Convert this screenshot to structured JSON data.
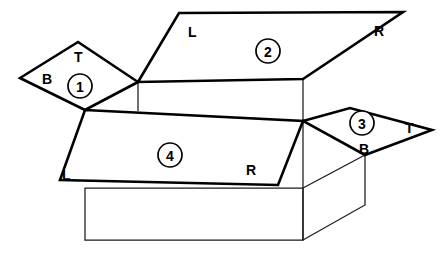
{
  "diagram": {
    "type": "line-drawing",
    "background_color": "#ffffff",
    "line_color": "#000000",
    "flaps": [
      {
        "id": "flap-1",
        "badge": "1",
        "badge_cx": 80,
        "badge_cy": 86,
        "position": "left",
        "edge_labels": [
          {
            "text": "T",
            "x": 74,
            "y": 62
          },
          {
            "text": "B",
            "x": 42,
            "y": 84
          }
        ]
      },
      {
        "id": "flap-2",
        "badge": "2",
        "badge_cx": 268,
        "badge_cy": 51,
        "position": "back",
        "edge_labels": [
          {
            "text": "L",
            "x": 188,
            "y": 37
          },
          {
            "text": "R",
            "x": 374,
            "y": 36
          }
        ]
      },
      {
        "id": "flap-3",
        "badge": "3",
        "badge_cx": 362,
        "badge_cy": 123,
        "position": "right",
        "edge_labels": [
          {
            "text": "T",
            "x": 405,
            "y": 133
          },
          {
            "text": "B",
            "x": 364,
            "y": 152
          }
        ]
      },
      {
        "id": "flap-4",
        "badge": "4",
        "badge_cx": 170,
        "badge_cy": 155,
        "position": "front",
        "edge_labels": [
          {
            "text": "L",
            "x": 67,
            "y": 178
          },
          {
            "text": "R",
            "x": 248,
            "y": 175
          }
        ]
      }
    ],
    "shapes": {
      "flap1_outline": "M 78,42 L 20,78 L 85,110 L 138,82 Z",
      "flap2_outline": "M 179,13 L 403,12 L 303,79 L 138,82 Z",
      "flap3_outline": "M 303,121 L 350,108 L 432,130 L 365,155 Z",
      "flap4_outline": "M 85,110 L 303,121 L 278,185 L 60,180 Z",
      "box_front": "M 85,188 L 303,188 L 303,240 L 85,240 Z",
      "box_right_side": "M 303,188 L 365,155 L 365,205 L 303,240 Z",
      "inner_left_diagonal": "M 85,110 L 138,82",
      "inner_vertical_left": "M 138,82 L 138,111",
      "inner_right_spoke_up": "M 303,121 L 303,79",
      "inner_right_vertical": "M 303,121 L 303,188",
      "back_top_rim": "M 138,82 L 303,79"
    }
  },
  "badge_radius": 12
}
